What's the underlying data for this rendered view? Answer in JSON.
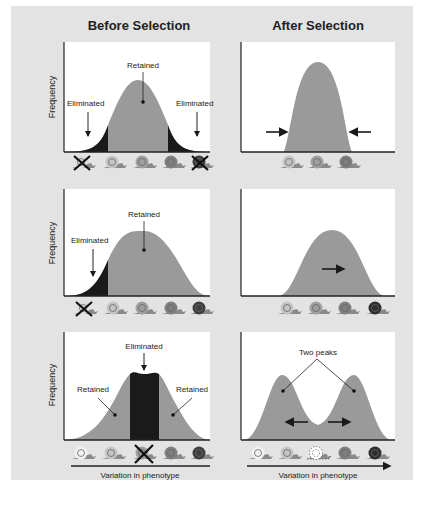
{
  "columns": {
    "before": "Before Selection",
    "after": "After Selection"
  },
  "axis": {
    "ylabel": "Frequency",
    "xlabel": "Variation in phenotype"
  },
  "rows": [
    {
      "name": "stabilizing",
      "before": {
        "labels": {
          "center": "Retained",
          "left": "Eliminated",
          "right": "Eliminated"
        }
      },
      "after": {
        "arrows": "inward",
        "snails": 3
      }
    },
    {
      "name": "directional",
      "before": {
        "labels": {
          "center": "Retained",
          "left": "Eliminated"
        }
      },
      "after": {
        "arrows": "right",
        "snails": 4
      }
    },
    {
      "name": "disruptive",
      "before": {
        "labels": {
          "center": "Eliminated",
          "left": "Retained",
          "right": "Retained"
        }
      },
      "after": {
        "labels": {
          "peaks": "Two peaks"
        },
        "arrows": "outward",
        "snails": 5
      }
    }
  ],
  "colors": {
    "background": "#e3e3e3",
    "plot_bg": "#ffffff",
    "retained": "#9a9a9a",
    "eliminated": "#1a1a1a",
    "axis": "#222222"
  }
}
